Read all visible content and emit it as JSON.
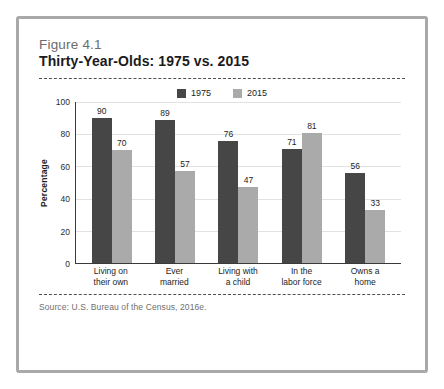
{
  "figure": {
    "number": "Figure 4.1",
    "title": "Thirty-Year-Olds: 1975 vs. 2015",
    "source": "Source: U.S. Bureau of the Census, 2016e."
  },
  "colors": {
    "series_1975": "#464646",
    "series_2015": "#aaaaaa",
    "frame": "#a9a9a9",
    "axis": "#3a3a3a",
    "gridline": "#e2e2e2",
    "title_text": "#1b1b1b",
    "figure_number_text": "#6c6c6c",
    "source_text": "#6f6f6f"
  },
  "chart_data": {
    "type": "bar",
    "title": "Thirty-Year-Olds: 1975 vs. 2015",
    "subtitle": "Figure 4.1",
    "xlabel": "",
    "ylabel": "Percentage",
    "ylim": [
      0,
      100
    ],
    "yticks": [
      0,
      20,
      40,
      60,
      80,
      100
    ],
    "ytick_labels": [
      "0",
      "20",
      "40",
      "60",
      "80",
      "100"
    ],
    "grid": true,
    "grid_axis": "y",
    "legend_position": "top-center",
    "categories": [
      "Living on\ntheir own",
      "Ever\nmarried",
      "Living with\na child",
      "In the\nlabor force",
      "Owns a\nhome"
    ],
    "category_lines": [
      [
        "Living on",
        "their own"
      ],
      [
        "Ever",
        "married"
      ],
      [
        "Living with",
        "a child"
      ],
      [
        "In the",
        "labor force"
      ],
      [
        "Owns a",
        "home"
      ]
    ],
    "series": [
      {
        "name": "1975",
        "color": "#464646",
        "values": [
          90,
          89,
          76,
          71,
          56
        ],
        "labels": [
          "90",
          "89",
          "76",
          "71",
          "56"
        ]
      },
      {
        "name": "2015",
        "color": "#aaaaaa",
        "values": [
          70,
          57,
          47,
          81,
          33
        ],
        "labels": [
          "70",
          "57",
          "47",
          "81",
          "33"
        ]
      }
    ]
  }
}
